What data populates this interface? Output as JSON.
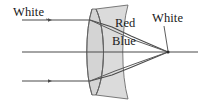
{
  "diagram": {
    "type": "optics-ray-diagram",
    "canvas": {
      "width": 205,
      "height": 104,
      "background": "#ffffff"
    },
    "labels": {
      "white_left": "White",
      "red": "Red",
      "blue": "Blue",
      "white_right": "White"
    },
    "colors": {
      "stroke": "#3f3f3f",
      "ray": "#4a4a4a",
      "lens_fill": "#d2d2d2",
      "lens_stroke": "#6b6b6b",
      "text": "#1a1a1a"
    },
    "geometry": {
      "optical_axis_y": 52,
      "ray_top_y": 20,
      "ray_bottom_y": 81,
      "incoming_ray_x_start": 22,
      "lens_left_x": 88,
      "lens_right_x": 130,
      "lens_top_y": 8,
      "lens_bottom_y": 96,
      "focal_point_x": 168,
      "focal_point_y": 52,
      "axis_x_end": 198
    },
    "elements": [
      {
        "name": "incoming-ray-top",
        "description": "horizontal white light ray above axis"
      },
      {
        "name": "incoming-ray-axis",
        "description": "horizontal white light ray along optical axis"
      },
      {
        "name": "incoming-ray-bottom",
        "description": "horizontal white light ray below axis"
      },
      {
        "name": "lens-element-crown",
        "description": "biconvex crown glass element"
      },
      {
        "name": "lens-element-flint",
        "description": "concave flint glass element"
      },
      {
        "name": "red-ray",
        "description": "refracted red component converging to focus"
      },
      {
        "name": "blue-ray",
        "description": "refracted blue component converging to focus"
      },
      {
        "name": "focal-point",
        "description": "common focus where red and blue recombine into white"
      },
      {
        "name": "leader-line",
        "description": "pointer from White label to focal point"
      }
    ]
  }
}
